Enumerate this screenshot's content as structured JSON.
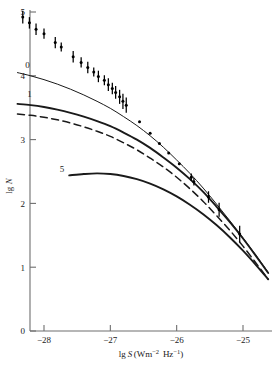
{
  "chart_data": {
    "type": "scatter",
    "title": "",
    "subtitle": "",
    "xlabel": "lg S(Wm⁻² Hz⁻¹)",
    "ylabel": "lg N",
    "xlabel_parts": {
      "lg": "lg",
      "S": "S",
      "open": "(Wm",
      "exp1": "−2",
      "mid": " Hz",
      "exp2": "−1",
      "close": ")"
    },
    "xlim": [
      -28.45,
      -24.55
    ],
    "ylim": [
      0,
      5.2
    ],
    "xticks": [
      -28,
      -27,
      -26,
      -25
    ],
    "xtick_labels": [
      "−28",
      "−27",
      "−26",
      "−25"
    ],
    "yticks": [
      0,
      1,
      2,
      3,
      4,
      5
    ],
    "ytick_labels": [
      "0",
      "1",
      "2",
      "3",
      "4",
      "5"
    ],
    "grid": false,
    "legend": "none",
    "series": [
      {
        "name": "observed-counts",
        "label": "",
        "type": "scatter-errorbar",
        "marker": "dot",
        "color": "#000000",
        "points": [
          {
            "x": -28.32,
            "y": 4.92,
            "yerr": 0.1
          },
          {
            "x": -28.22,
            "y": 4.83,
            "yerr": 0.09
          },
          {
            "x": -28.12,
            "y": 4.73,
            "yerr": 0.09
          },
          {
            "x": -28.0,
            "y": 4.66,
            "yerr": 0.08
          },
          {
            "x": -27.83,
            "y": 4.52,
            "yerr": 0.09
          },
          {
            "x": -27.74,
            "y": 4.45,
            "yerr": 0.07
          },
          {
            "x": -27.56,
            "y": 4.3,
            "yerr": 0.09
          },
          {
            "x": -27.44,
            "y": 4.21,
            "yerr": 0.08
          },
          {
            "x": -27.34,
            "y": 4.13,
            "yerr": 0.09
          },
          {
            "x": -27.25,
            "y": 4.06,
            "yerr": 0.07
          },
          {
            "x": -27.18,
            "y": 3.99,
            "yerr": 0.09
          },
          {
            "x": -27.09,
            "y": 3.93,
            "yerr": 0.08
          },
          {
            "x": -27.03,
            "y": 3.86,
            "yerr": 0.1
          },
          {
            "x": -26.97,
            "y": 3.8,
            "yerr": 0.09
          },
          {
            "x": -26.92,
            "y": 3.74,
            "yerr": 0.1
          },
          {
            "x": -26.86,
            "y": 3.67,
            "yerr": 0.11
          },
          {
            "x": -26.81,
            "y": 3.6,
            "yerr": 0.12
          },
          {
            "x": -26.76,
            "y": 3.54,
            "yerr": 0.12
          },
          {
            "x": -26.56,
            "y": 3.28,
            "yerr": 0.0
          },
          {
            "x": -26.4,
            "y": 3.1,
            "yerr": 0.0
          },
          {
            "x": -26.26,
            "y": 2.94,
            "yerr": 0.0
          },
          {
            "x": -26.12,
            "y": 2.79,
            "yerr": 0.0
          },
          {
            "x": -25.96,
            "y": 2.62,
            "yerr": 0.0
          },
          {
            "x": -25.78,
            "y": 2.41,
            "yerr": 0.06
          },
          {
            "x": -25.74,
            "y": 2.34,
            "yerr": 0.06
          },
          {
            "x": -25.52,
            "y": 2.1,
            "yerr": 0.09
          },
          {
            "x": -25.36,
            "y": 1.9,
            "yerr": 0.11
          },
          {
            "x": -25.05,
            "y": 1.52,
            "yerr": 0.13
          }
        ]
      },
      {
        "name": "model-0",
        "label": "0",
        "type": "line",
        "style": "solid-thin",
        "color": "#1a1a1a",
        "label_at": {
          "x": -28.25,
          "y": 4.12
        },
        "path": [
          {
            "x": -28.4,
            "y": 4.05
          },
          {
            "x": -28.2,
            "y": 4.0
          },
          {
            "x": -28.0,
            "y": 3.94
          },
          {
            "x": -27.8,
            "y": 3.87
          },
          {
            "x": -27.6,
            "y": 3.79
          },
          {
            "x": -27.4,
            "y": 3.7
          },
          {
            "x": -27.2,
            "y": 3.6
          },
          {
            "x": -27.0,
            "y": 3.49
          },
          {
            "x": -26.8,
            "y": 3.36
          },
          {
            "x": -26.6,
            "y": 3.22
          },
          {
            "x": -26.4,
            "y": 3.06
          },
          {
            "x": -26.2,
            "y": 2.88
          },
          {
            "x": -26.0,
            "y": 2.68
          },
          {
            "x": -25.8,
            "y": 2.47
          },
          {
            "x": -25.6,
            "y": 2.24
          },
          {
            "x": -25.4,
            "y": 1.99
          },
          {
            "x": -25.2,
            "y": 1.73
          },
          {
            "x": -25.0,
            "y": 1.46
          },
          {
            "x": -24.8,
            "y": 1.18
          },
          {
            "x": -24.62,
            "y": 0.92
          }
        ]
      },
      {
        "name": "model-1",
        "label": "1",
        "type": "line",
        "style": "solid-thick",
        "color": "#1a1a1a",
        "label_at": {
          "x": -28.22,
          "y": 3.66
        },
        "path": [
          {
            "x": -28.4,
            "y": 3.56
          },
          {
            "x": -28.2,
            "y": 3.54
          },
          {
            "x": -28.0,
            "y": 3.51
          },
          {
            "x": -27.8,
            "y": 3.47
          },
          {
            "x": -27.6,
            "y": 3.42
          },
          {
            "x": -27.4,
            "y": 3.36
          },
          {
            "x": -27.2,
            "y": 3.29
          },
          {
            "x": -27.0,
            "y": 3.21
          },
          {
            "x": -26.8,
            "y": 3.11
          },
          {
            "x": -26.6,
            "y": 3.0
          },
          {
            "x": -26.4,
            "y": 2.87
          },
          {
            "x": -26.2,
            "y": 2.72
          },
          {
            "x": -26.0,
            "y": 2.56
          },
          {
            "x": -25.8,
            "y": 2.38
          },
          {
            "x": -25.6,
            "y": 2.18
          },
          {
            "x": -25.4,
            "y": 1.95
          },
          {
            "x": -25.2,
            "y": 1.71
          },
          {
            "x": -25.0,
            "y": 1.45
          },
          {
            "x": -24.8,
            "y": 1.17
          },
          {
            "x": -24.62,
            "y": 0.91
          }
        ]
      },
      {
        "name": "model-dashed",
        "label": "",
        "type": "line",
        "style": "dashed",
        "color": "#1a1a1a",
        "path": [
          {
            "x": -28.4,
            "y": 3.4
          },
          {
            "x": -28.2,
            "y": 3.38
          },
          {
            "x": -28.0,
            "y": 3.35
          },
          {
            "x": -27.8,
            "y": 3.31
          },
          {
            "x": -27.6,
            "y": 3.26
          },
          {
            "x": -27.4,
            "y": 3.2
          },
          {
            "x": -27.2,
            "y": 3.13
          },
          {
            "x": -27.0,
            "y": 3.05
          },
          {
            "x": -26.8,
            "y": 2.95
          },
          {
            "x": -26.6,
            "y": 2.84
          },
          {
            "x": -26.4,
            "y": 2.71
          },
          {
            "x": -26.2,
            "y": 2.57
          },
          {
            "x": -26.0,
            "y": 2.41
          },
          {
            "x": -25.8,
            "y": 2.23
          },
          {
            "x": -25.6,
            "y": 2.03
          },
          {
            "x": -25.4,
            "y": 1.81
          },
          {
            "x": -25.2,
            "y": 1.58
          },
          {
            "x": -25.0,
            "y": 1.33
          },
          {
            "x": -24.8,
            "y": 1.06
          },
          {
            "x": -24.62,
            "y": 0.81
          }
        ]
      },
      {
        "name": "model-5",
        "label": "5",
        "type": "line",
        "style": "solid-thick",
        "color": "#1a1a1a",
        "label_at": {
          "x": -27.73,
          "y": 2.5
        },
        "path": [
          {
            "x": -27.62,
            "y": 2.44
          },
          {
            "x": -27.4,
            "y": 2.46
          },
          {
            "x": -27.2,
            "y": 2.47
          },
          {
            "x": -27.0,
            "y": 2.46
          },
          {
            "x": -26.8,
            "y": 2.43
          },
          {
            "x": -26.6,
            "y": 2.38
          },
          {
            "x": -26.4,
            "y": 2.31
          },
          {
            "x": -26.2,
            "y": 2.22
          },
          {
            "x": -26.0,
            "y": 2.11
          },
          {
            "x": -25.8,
            "y": 1.98
          },
          {
            "x": -25.6,
            "y": 1.83
          },
          {
            "x": -25.4,
            "y": 1.66
          },
          {
            "x": -25.2,
            "y": 1.47
          },
          {
            "x": -25.0,
            "y": 1.26
          },
          {
            "x": -24.8,
            "y": 1.03
          },
          {
            "x": -24.62,
            "y": 0.81
          }
        ]
      }
    ]
  },
  "axes": {
    "x_tick_values": [
      "−28",
      "−27",
      "−26",
      "−25"
    ],
    "y_tick_values": [
      "0",
      "1",
      "2",
      "3",
      "4",
      "5"
    ],
    "x_title": "lg S(Wm⁻² Hz⁻¹)",
    "y_title": "lg N"
  }
}
